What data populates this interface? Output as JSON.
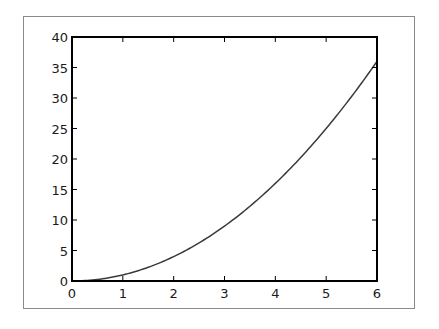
{
  "chart_data": {
    "type": "line",
    "title": "",
    "xlabel": "",
    "ylabel": "",
    "xlim": [
      0,
      6
    ],
    "ylim": [
      0,
      40
    ],
    "x_ticks": [
      0,
      1,
      2,
      3,
      4,
      5,
      6
    ],
    "x_tick_labels": [
      "0",
      "1",
      "2",
      "3",
      "4",
      "5",
      "6"
    ],
    "y_ticks": [
      0,
      5,
      10,
      15,
      20,
      25,
      30,
      35,
      40
    ],
    "y_tick_labels": [
      "0",
      "5",
      "10",
      "15",
      "20",
      "25",
      "30",
      "35",
      "40"
    ],
    "grid": false,
    "legend": null,
    "series": [
      {
        "name": "y = x^2",
        "color": "#3a3a3a",
        "x": [
          0,
          0.5,
          1,
          1.5,
          2,
          2.5,
          3,
          3.5,
          4,
          4.5,
          5,
          5.5,
          6
        ],
        "y": [
          0,
          0.25,
          1,
          2.25,
          4,
          6.25,
          9,
          12.25,
          16,
          20.25,
          25,
          30.25,
          36
        ]
      }
    ]
  },
  "style": {
    "axis_color": "#000000",
    "frame_border_color": "#8a8a8a",
    "line_color": "#3a3a3a"
  }
}
